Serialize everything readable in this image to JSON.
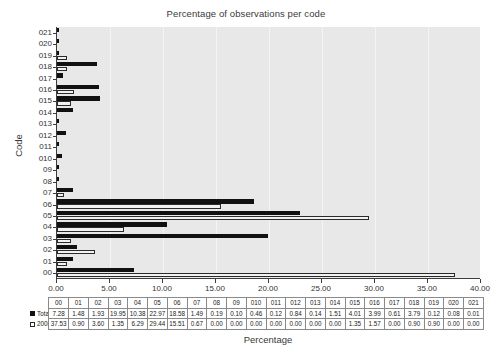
{
  "chart_data": {
    "type": "bar",
    "orientation": "horizontal",
    "title": "Percentage of observations per code",
    "xlabel": "Percentage",
    "ylabel": "Code",
    "xlim": [
      0,
      40
    ],
    "xticks": [
      "0.00",
      "5.00",
      "10.00",
      "15.00",
      "20.00",
      "25.00",
      "30.00",
      "35.00",
      "40.00"
    ],
    "xtick_values": [
      0,
      5,
      10,
      15,
      20,
      25,
      30,
      35,
      40
    ],
    "grid": "vertical",
    "legend_position": "table-row-headers",
    "categories": [
      "00",
      "01",
      "02",
      "03",
      "04",
      "05",
      "06",
      "07",
      "08",
      "09",
      "010",
      "011",
      "012",
      "013",
      "014",
      "015",
      "016",
      "017",
      "018",
      "019",
      "020",
      "021"
    ],
    "series": [
      {
        "name": "Total",
        "swatch": "filled-black",
        "values": [
          7.28,
          1.48,
          1.93,
          19.95,
          10.38,
          22.97,
          18.58,
          1.49,
          0.19,
          0.1,
          0.46,
          0.12,
          0.84,
          0.14,
          1.51,
          4.01,
          3.99,
          0.61,
          3.79,
          0.12,
          0.08,
          0.01
        ]
      },
      {
        "name": "2008",
        "swatch": "hollow-white",
        "values": [
          37.53,
          0.9,
          3.6,
          1.35,
          6.29,
          29.44,
          15.51,
          0.67,
          0.0,
          0.0,
          0.0,
          0.0,
          0.0,
          0.0,
          0.0,
          1.35,
          1.57,
          0.0,
          0.9,
          0.9,
          0.0,
          0.0
        ]
      }
    ]
  },
  "colors": {
    "plot_background": "#e8e8e8",
    "total_series": "#111111",
    "y2008_series": "#f2f2f2",
    "axis": "#3c3c3c"
  }
}
